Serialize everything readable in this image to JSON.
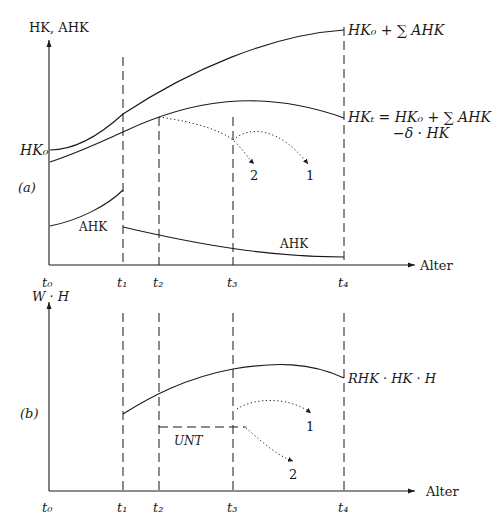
{
  "panel_a": {
    "tag": "(a)",
    "y_axis_label": "HK, AHK",
    "x_axis_label": "Alter",
    "y_tick_label": "HK₀",
    "time_ticks": [
      "t₀",
      "t₁",
      "t₂",
      "t₃",
      "t₄"
    ],
    "curve_upper_label": "HK₀ + ∑ AHK",
    "curve_middle_label_line1": "HKₜ = HK₀ + ∑ AHK",
    "curve_middle_label_line2": "−δ · HK",
    "ahk_label_left": "AHK",
    "ahk_label_right": "AHK",
    "path_label_1": "1",
    "path_label_2": "2"
  },
  "panel_b": {
    "tag": "(b)",
    "y_axis_label": "W · H",
    "x_axis_label": "Alter",
    "time_ticks": [
      "t₀",
      "t₁",
      "t₂",
      "t₃",
      "t₄"
    ],
    "curve_label": "RHK · HK · H",
    "unt_label": "UNT",
    "path_label_1": "1",
    "path_label_2": "2"
  }
}
